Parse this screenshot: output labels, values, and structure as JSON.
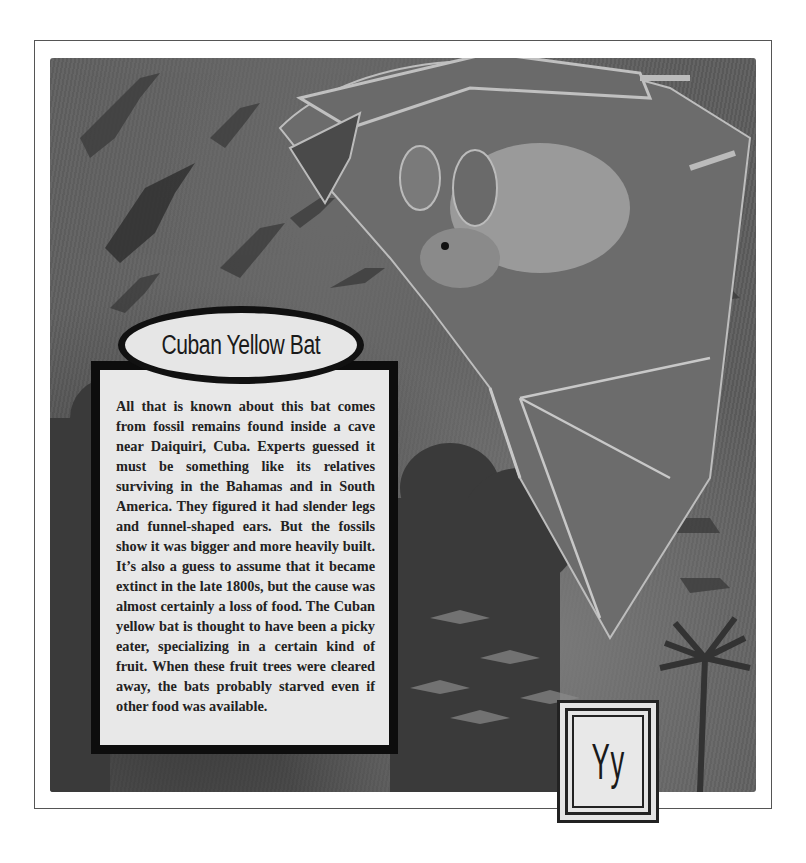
{
  "page": {
    "title": "Cuban Yellow Bat",
    "letter": "Yy",
    "body_text": "All that is known about this bat comes from fossil remains found inside a cave near Daiquiri, Cuba. Experts guessed it must be something like its relatives surviving in the Bahamas and in South America. They figured it had slender legs and funnel-shaped ears. But the fossils show it was bigger and more heavily built. It’s also a guess to assume that it became extinct in the late 1800s, but the cause was almost certainly a loss of food. The Cuban yellow bat is thought to have been a picky eater, specializing in a certain kind of fruit. When these fruit trees were cleared away, the bats probably starved even if other food was available."
  },
  "illustration": {
    "subject": "large bat with funnel-shaped ears in flight over tropical forest",
    "background_elements": [
      "flock of bat silhouettes",
      "trees",
      "palm trees",
      "dusk sky"
    ]
  },
  "colors": {
    "frame": "#555555",
    "illustration_bg": "#5e5e5e",
    "panel_bg": "#e8e8e8",
    "panel_border": "#0d0d0d"
  }
}
